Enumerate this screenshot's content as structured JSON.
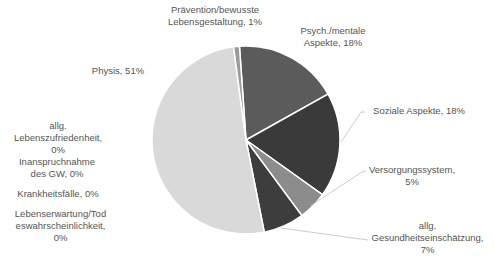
{
  "chart_data": {
    "type": "pie",
    "title": "",
    "categories": [
      "Psych./mentale Aspekte",
      "Soziale Aspekte",
      "Versorgungssystem",
      "allg. Gesundheitseinschätzung",
      "Physis",
      "Lebenserwartung/Todeswahrscheinlichkeit",
      "Krankheitsfälle",
      "Inanspruchnahme des GW",
      "allg. Lebenszufriedenheit",
      "Prävention/bewusste Lebensgestaltung"
    ],
    "values": [
      18,
      18,
      5,
      7,
      51,
      0,
      0,
      0,
      0,
      1
    ],
    "unit": "%",
    "colors": [
      "#5b5b5b",
      "#3a3a3a",
      "#8c8c8c",
      "#3d3d3d",
      "#d9d9d9",
      "#bfbfbf",
      "#a6a6a6",
      "#7f7f7f",
      "#cccccc",
      "#9a9a9a"
    ],
    "start_angle_deg": -4,
    "legend": "none",
    "data_labels": true
  },
  "labels": {
    "praevention": [
      "Prävention/bewusste",
      "Lebensgestaltung, 1%"
    ],
    "psych": [
      "Psych./mentale",
      "Aspekte, 18%"
    ],
    "physis": [
      "Physis, 51%"
    ],
    "soziale": [
      "Soziale Aspekte, 18%"
    ],
    "lebenszufriedenheit": [
      "allg.",
      "Lebenszufriedenheit,",
      "0%"
    ],
    "inanspruchnahme": [
      "Inanspruchnahme",
      "des GW, 0%"
    ],
    "krankheitsfaelle": [
      "Krankheitsfälle, 0%"
    ],
    "lebenserwartung": [
      "Lebenserwartung/Tod",
      "eswahrscheinlichkeit,",
      "0%"
    ],
    "versorgung": [
      "Versorgungssystem,",
      "5%"
    ],
    "gesundheit": [
      "allg.",
      "Gesundheitseinschätzung,",
      "7%"
    ]
  }
}
